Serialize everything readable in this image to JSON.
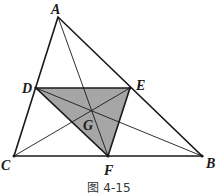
{
  "figure": {
    "caption": "图 4-15",
    "points": {
      "A": {
        "label": "A",
        "x": 58,
        "y": 17
      },
      "B": {
        "label": "B",
        "x": 202,
        "y": 156
      },
      "C": {
        "label": "C",
        "x": 14,
        "y": 156
      },
      "D": {
        "label": "D",
        "x": 36,
        "y": 88
      },
      "E": {
        "label": "E",
        "x": 130,
        "y": 88
      },
      "F": {
        "label": "F",
        "x": 108,
        "y": 156
      },
      "G": {
        "label": "G",
        "x": 92,
        "y": 109
      }
    },
    "shaded_triangle": [
      "D",
      "E",
      "F"
    ],
    "shade_color": "#a6a6a6",
    "line_color": "#1a1a1a"
  }
}
